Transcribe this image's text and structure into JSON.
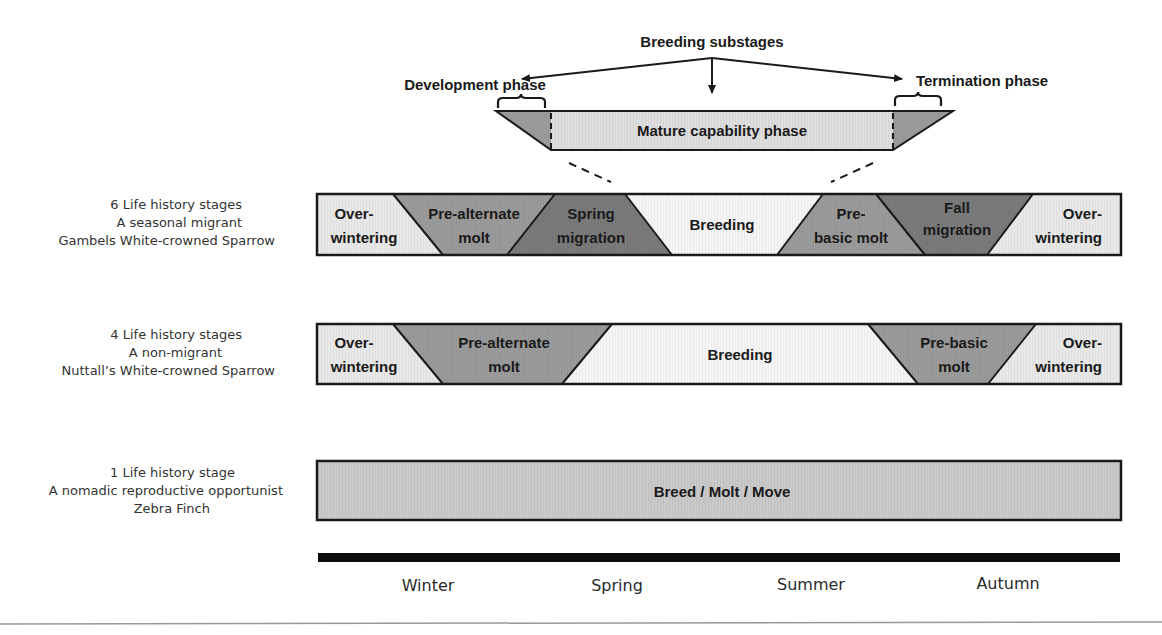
{
  "colors": {
    "light": "#e6e6e6",
    "lighter": "#f4f4f4",
    "medium": "#999999",
    "dark": "#777777",
    "mature": "#dcdcdc",
    "border": "#1a1a1a",
    "axis": "#0d0d0d",
    "divider": "#999999"
  },
  "header": {
    "breeding_substages": "Breeding substages",
    "development_phase": "Development phase",
    "termination_phase": "Termination phase",
    "mature_capability_phase": "Mature capability phase"
  },
  "rows": [
    {
      "side_lines": [
        "6 Life history stages",
        "A seasonal migrant",
        "Gambels White-crowned Sparrow"
      ],
      "stages": [
        {
          "l1": "Over-",
          "l2": "wintering"
        },
        {
          "l1": "Pre-alternate",
          "l2": "molt"
        },
        {
          "l1": "Spring",
          "l2": "migration"
        },
        {
          "l1": "Breeding",
          "l2": ""
        },
        {
          "l1": "Pre-",
          "l2": "basic molt"
        },
        {
          "l1": "Fall",
          "l2": "migration"
        },
        {
          "l1": "Over-",
          "l2": "wintering"
        }
      ]
    },
    {
      "side_lines": [
        "4 Life history stages",
        "A non-migrant",
        "Nuttall’s White-crowned Sparrow"
      ],
      "stages": [
        {
          "l1": "Over-",
          "l2": "wintering"
        },
        {
          "l1": "Pre-alternate",
          "l2": "molt"
        },
        {
          "l1": "Breeding",
          "l2": ""
        },
        {
          "l1": "Pre-basic",
          "l2": "molt"
        },
        {
          "l1": "Over-",
          "l2": "wintering"
        }
      ]
    },
    {
      "side_lines": [
        "1 Life history stage",
        "A nomadic reproductive opportunist",
        "Zebra Finch"
      ],
      "stages": [
        {
          "l1": "Breed / Molt / Move",
          "l2": ""
        }
      ]
    }
  ],
  "seasons": [
    "Winter",
    "Spring",
    "Summer",
    "Autumn"
  ]
}
